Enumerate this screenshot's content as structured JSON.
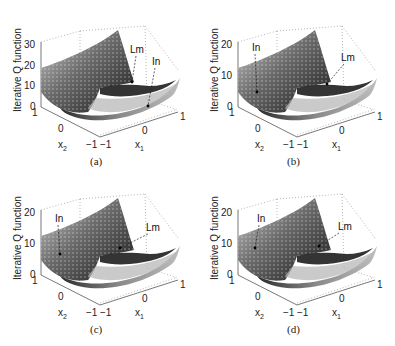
{
  "figure": {
    "panels": [
      {
        "id": "a",
        "caption": "(a)",
        "ylabel": "Iterative Q function",
        "zticks": [
          "0",
          "10",
          "20",
          "30"
        ],
        "x2ticks": [
          "1",
          "0",
          "−1"
        ],
        "x1ticks": [
          "−1",
          "0",
          "1"
        ],
        "x1label": "x1",
        "x2label": "x2",
        "annotations": [
          "Lm",
          "In"
        ]
      },
      {
        "id": "b",
        "caption": "(b)",
        "ylabel": "Iterative Q function",
        "zticks": [
          "0",
          "10",
          "20"
        ],
        "x2ticks": [
          "1",
          "0",
          "−1"
        ],
        "x1ticks": [
          "−1",
          "0",
          "1"
        ],
        "x1label": "x1",
        "x2label": "x2",
        "annotations": [
          "In",
          "Lm"
        ]
      },
      {
        "id": "c",
        "caption": "(c)",
        "ylabel": "Iterative Q function",
        "zticks": [
          "0",
          "10",
          "20"
        ],
        "x2ticks": [
          "1",
          "0",
          "−1"
        ],
        "x1ticks": [
          "−1",
          "0",
          "1"
        ],
        "x1label": "x1",
        "x2label": "x2",
        "annotations": [
          "In",
          "Lm"
        ]
      },
      {
        "id": "d",
        "caption": "(d)",
        "ylabel": "Iterative Q function",
        "zticks": [
          "0",
          "10",
          "20"
        ],
        "x2ticks": [
          "1",
          "0",
          "−1"
        ],
        "x1ticks": [
          "−1",
          "0",
          "1"
        ],
        "x1label": "x1",
        "x2label": "x2",
        "annotations": [
          "In",
          "Lm"
        ]
      }
    ]
  },
  "chart_data": [
    {
      "type": "surface3d",
      "title": "(a)",
      "xlabel": "x1",
      "ylabel": "x2",
      "zlabel": "Iterative Q function",
      "xlim": [
        -1,
        1
      ],
      "ylim": [
        -1,
        1
      ],
      "zlim": [
        0,
        30
      ],
      "zticks": [
        0,
        10,
        20,
        30
      ],
      "annotations": [
        {
          "text": "Lm",
          "note": "local minimum marker"
        },
        {
          "text": "In",
          "note": "initial point marker"
        }
      ]
    },
    {
      "type": "surface3d",
      "title": "(b)",
      "xlabel": "x1",
      "ylabel": "x2",
      "zlabel": "Iterative Q function",
      "xlim": [
        -1,
        1
      ],
      "ylim": [
        -1,
        1
      ],
      "zlim": [
        0,
        20
      ],
      "zticks": [
        0,
        10,
        20
      ],
      "annotations": [
        {
          "text": "In"
        },
        {
          "text": "Lm"
        }
      ]
    },
    {
      "type": "surface3d",
      "title": "(c)",
      "xlabel": "x1",
      "ylabel": "x2",
      "zlabel": "Iterative Q function",
      "xlim": [
        -1,
        1
      ],
      "ylim": [
        -1,
        1
      ],
      "zlim": [
        0,
        20
      ],
      "zticks": [
        0,
        10,
        20
      ],
      "annotations": [
        {
          "text": "In"
        },
        {
          "text": "Lm"
        }
      ]
    },
    {
      "type": "surface3d",
      "title": "(d)",
      "xlabel": "x1",
      "ylabel": "x2",
      "zlabel": "Iterative Q function",
      "xlim": [
        -1,
        1
      ],
      "ylim": [
        -1,
        1
      ],
      "zlim": [
        0,
        20
      ],
      "zticks": [
        0,
        10,
        20
      ],
      "annotations": [
        {
          "text": "In"
        },
        {
          "text": "Lm"
        }
      ]
    }
  ]
}
